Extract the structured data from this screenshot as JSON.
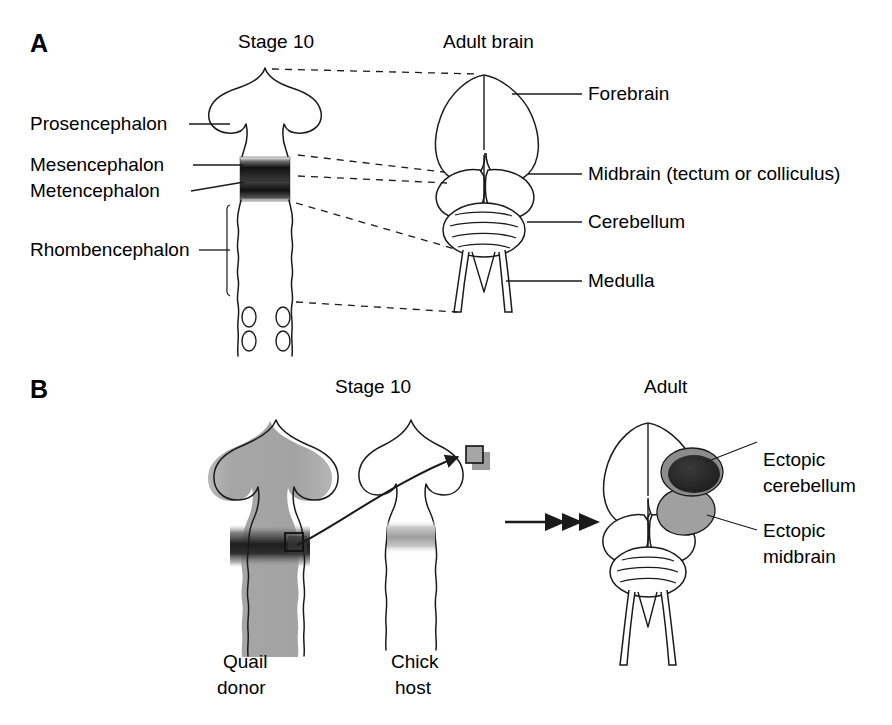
{
  "figure": {
    "background_color": "#ffffff",
    "ink_color": "#1a1a1a"
  },
  "panels": [
    {
      "id": "A",
      "letter": "A",
      "headers": [
        {
          "name": "stage-10",
          "text": "Stage 10"
        },
        {
          "name": "adult-brain",
          "text": "Adult brain"
        }
      ],
      "left_labels": [
        {
          "name": "prosencephalon",
          "text": "Prosencephalon"
        },
        {
          "name": "mesencephalon",
          "text": "Mesencephalon"
        },
        {
          "name": "metencephalon",
          "text": "Metencephalon"
        },
        {
          "name": "rhombencephalon",
          "text": "Rhombencephalon"
        }
      ],
      "right_labels": [
        {
          "name": "forebrain",
          "text": "Forebrain"
        },
        {
          "name": "midbrain",
          "text": "Midbrain (tectum or colliculus)"
        },
        {
          "name": "cerebellum",
          "text": "Cerebellum"
        },
        {
          "name": "medulla",
          "text": "Medulla"
        }
      ]
    },
    {
      "id": "B",
      "letter": "B",
      "headers": [
        {
          "name": "stage-10",
          "text": "Stage 10"
        },
        {
          "name": "adult",
          "text": "Adult"
        }
      ],
      "specimen_labels": [
        {
          "name": "quail-donor",
          "line1": "Quail",
          "line2": "donor"
        },
        {
          "name": "chick-host",
          "line1": "Chick",
          "line2": "host"
        }
      ],
      "result_labels": [
        {
          "name": "ectopic-cerebellum",
          "line1": "Ectopic",
          "line2": "cerebellum"
        },
        {
          "name": "ectopic-midbrain",
          "line1": "Ectopic",
          "line2": "midbrain"
        }
      ]
    }
  ],
  "colors": {
    "outline": "#1a1a1a",
    "quail_fill": "#a8a8a8",
    "isthmus_dark": "#141414",
    "chick_band": "#b4b4b4",
    "ectopic_cerebellum": "#2b2b2b",
    "ectopic_cerebellum_ring": "#8c8c8c",
    "ectopic_midbrain": "#a0a0a0",
    "graft_square": "#9a9a9a"
  }
}
